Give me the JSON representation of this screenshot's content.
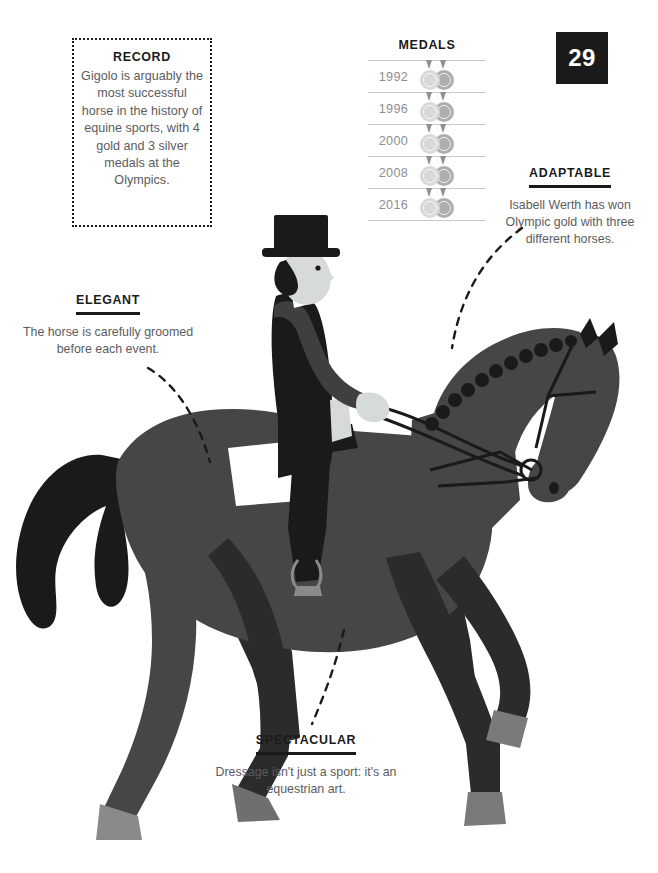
{
  "page": {
    "number": "29",
    "background": "#ffffff",
    "ink": "#1a1a1a",
    "body_text_color": "#5c5c60"
  },
  "record_card": {
    "heading": "RECORD",
    "body": "Gigolo is arguably the most successful horse in the history of equine sports, with 4 gold and 3 silver medals at the Olympics."
  },
  "medals": {
    "title": "MEDALS",
    "rows": [
      {
        "year": "1992",
        "count": 2,
        "types": [
          "gold",
          "silver"
        ]
      },
      {
        "year": "1996",
        "count": 2,
        "types": [
          "gold",
          "silver"
        ]
      },
      {
        "year": "2000",
        "count": 2,
        "types": [
          "gold",
          "silver"
        ]
      },
      {
        "year": "2008",
        "count": 2,
        "types": [
          "gold",
          "silver"
        ]
      },
      {
        "year": "2016",
        "count": 2,
        "types": [
          "gold",
          "silver"
        ]
      }
    ],
    "gold_color": "#d9d9d9",
    "silver_color": "#adadb2",
    "rule_color": "#c9c9c9"
  },
  "callouts": {
    "adaptable": {
      "heading": "ADAPTABLE",
      "body": "Isabell Werth has won Olympic gold with three different horses."
    },
    "elegant": {
      "heading": "ELEGANT",
      "body": "The horse is carefully groomed before each event."
    },
    "spectacular": {
      "heading": "SPECTACULAR",
      "body": "Dressage isn't just a sport: it's an equestrian art."
    }
  },
  "illustration": {
    "subject": "dressage-horse-and-rider",
    "horse_body_color": "#464646",
    "horse_shadow_color": "#2b2b2b",
    "horse_tail_color": "#1a1a1a",
    "hoof_color": "#8a8a8a",
    "rider_coat_color": "#1a1a1a",
    "rider_sleeve_color": "#3f3f3f",
    "rider_skin_color": "#d7dadb",
    "saddle_pad_color": "#ffffff",
    "stirrup_color": "#8a8a8a"
  }
}
